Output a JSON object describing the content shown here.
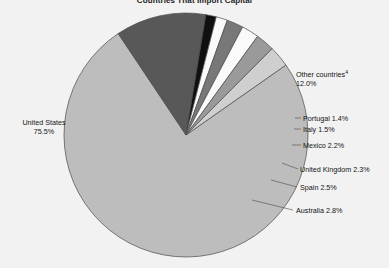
{
  "chart_data": {
    "type": "pie",
    "title": "Countries That Import Capital",
    "xlabel": "",
    "ylabel": "",
    "legend_position": "none",
    "grid": false,
    "units": "percent",
    "categories": [
      "United States",
      "Other countries",
      "Australia",
      "Spain",
      "United Kingdom",
      "Mexico",
      "Italy",
      "Portugal"
    ],
    "values": [
      75.5,
      12.0,
      2.8,
      2.5,
      2.3,
      2.2,
      1.5,
      1.4
    ],
    "slices": [
      {
        "name": "United States",
        "label": "United States",
        "value": 75.5,
        "value_text": "75.5%",
        "color": "#bdbdbd",
        "footnote": ""
      },
      {
        "name": "Other countries",
        "label": "Other countries",
        "value": 12.0,
        "value_text": "12.0%",
        "color": "#585858",
        "footnote": "4"
      },
      {
        "name": "Portugal",
        "label": "Portugal 1.4%",
        "value": 1.4,
        "value_text": "1.4%",
        "color": "#101010",
        "footnote": ""
      },
      {
        "name": "Italy",
        "label": "Italy 1.5%",
        "value": 1.5,
        "value_text": "1.5%",
        "color": "#fafafa",
        "footnote": ""
      },
      {
        "name": "Mexico",
        "label": "Mexico 2.2%",
        "value": 2.2,
        "value_text": "2.2%",
        "color": "#787878",
        "footnote": ""
      },
      {
        "name": "United Kingdom",
        "label": "United Kingdom 2.3%",
        "value": 2.3,
        "value_text": "2.3%",
        "color": "#fafafa",
        "footnote": ""
      },
      {
        "name": "Spain",
        "label": "Spain 2.5%",
        "value": 2.5,
        "value_text": "2.5%",
        "color": "#9a9a9a",
        "footnote": ""
      },
      {
        "name": "Australia",
        "label": "Australia 2.8%",
        "value": 2.8,
        "value_text": "2.8%",
        "color": "#cfcfcf",
        "footnote": ""
      }
    ]
  },
  "labels": {
    "united_states_name": "United States",
    "united_states_value": "75.5%",
    "other_countries_name": "Other countries",
    "other_countries_footnote": "4",
    "other_countries_value": "12.0%",
    "portugal": "Portugal 1.4%",
    "italy": "Italy 1.5%",
    "mexico": "Mexico 2.2%",
    "united_kingdom": "United Kingdom 2.3%",
    "spain": "Spain 2.5%",
    "australia": "Australia 2.8%"
  },
  "colors": {
    "background": "#f2f2f2",
    "outline": "#4a4a4a",
    "text": "#141414"
  }
}
